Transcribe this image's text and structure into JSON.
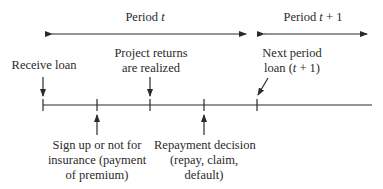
{
  "diagram": {
    "periods": [
      {
        "label": "Period",
        "var": "t",
        "suffix": ""
      },
      {
        "label": "Period",
        "var": "t",
        "suffix": " + 1"
      }
    ],
    "events_above": [
      {
        "line1": "Receive loan",
        "line2": ""
      },
      {
        "line1": "Project returns",
        "line2": "are realized"
      },
      {
        "line1": "Next period",
        "line2_pre": "loan (",
        "line2_var": "t",
        "line2_post": " + 1)"
      }
    ],
    "events_below": [
      {
        "line1": "Sign up or not for",
        "line2": "insurance (payment",
        "line3": "of premium)"
      },
      {
        "line1": "Repayment decision",
        "line2": "(repay, claim,",
        "line3": "default)"
      }
    ],
    "colors": {
      "line": "#2a2a2a",
      "background": "#ffffff"
    }
  }
}
